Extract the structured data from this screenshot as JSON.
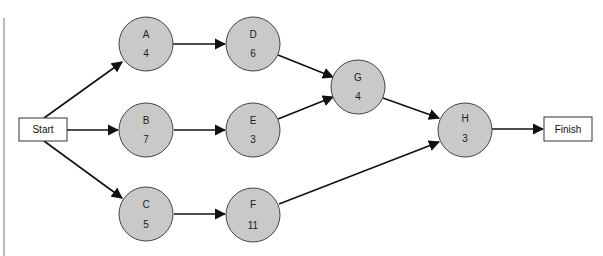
{
  "diagram": {
    "type": "activity-on-node network",
    "start": {
      "label": "Start"
    },
    "finish": {
      "label": "Finish"
    },
    "nodes": [
      {
        "id": "A",
        "label": "A",
        "duration": "4"
      },
      {
        "id": "B",
        "label": "B",
        "duration": "7"
      },
      {
        "id": "C",
        "label": "C",
        "duration": "5"
      },
      {
        "id": "D",
        "label": "D",
        "duration": "6"
      },
      {
        "id": "E",
        "label": "E",
        "duration": "3"
      },
      {
        "id": "F",
        "label": "F",
        "duration": "11"
      },
      {
        "id": "G",
        "label": "G",
        "duration": "4"
      },
      {
        "id": "H",
        "label": "H",
        "duration": "3"
      }
    ],
    "edges": [
      [
        "Start",
        "A"
      ],
      [
        "Start",
        "B"
      ],
      [
        "Start",
        "C"
      ],
      [
        "A",
        "D"
      ],
      [
        "B",
        "E"
      ],
      [
        "C",
        "F"
      ],
      [
        "D",
        "G"
      ],
      [
        "E",
        "G"
      ],
      [
        "G",
        "H"
      ],
      [
        "F",
        "H"
      ],
      [
        "H",
        "Finish"
      ]
    ]
  }
}
